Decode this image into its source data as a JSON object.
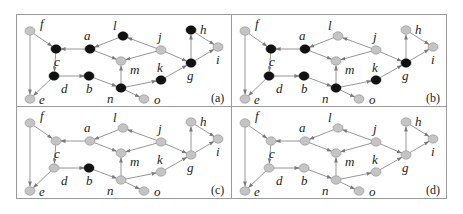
{
  "figure": {
    "colors": {
      "active_node": "#111111",
      "inactive_node": "#c4c4c4",
      "inactive_stroke": "#8f8f8f",
      "edge": "#8a8a8a",
      "border": "#9a9a9a"
    },
    "nodes": [
      {
        "id": "f",
        "x": 14,
        "y": 17,
        "lx": 10,
        "ly": -3
      },
      {
        "id": "c",
        "x": 40,
        "y": 35,
        "lx": -2,
        "ly": 17
      },
      {
        "id": "a",
        "x": 74,
        "y": 35,
        "lx": -6,
        "ly": -9
      },
      {
        "id": "l",
        "x": 107,
        "y": 22,
        "lx": -10,
        "ly": -6
      },
      {
        "id": "j",
        "x": 145,
        "y": 36,
        "lx": -3,
        "ly": -9
      },
      {
        "id": "h",
        "x": 175,
        "y": 16,
        "lx": 9,
        "ly": 4
      },
      {
        "id": "i",
        "x": 202,
        "y": 33,
        "lx": -2,
        "ly": 17
      },
      {
        "id": "m",
        "x": 105,
        "y": 47,
        "lx": 9,
        "ly": 13
      },
      {
        "id": "g",
        "x": 175,
        "y": 49,
        "lx": -4,
        "ly": 17
      },
      {
        "id": "d",
        "x": 38,
        "y": 62,
        "lx": 7,
        "ly": 17
      },
      {
        "id": "b",
        "x": 73,
        "y": 62,
        "lx": -3,
        "ly": 17
      },
      {
        "id": "k",
        "x": 145,
        "y": 66,
        "lx": -4,
        "ly": -8
      },
      {
        "id": "n",
        "x": 105,
        "y": 74,
        "lx": -14,
        "ly": 15
      },
      {
        "id": "e",
        "x": 14,
        "y": 85,
        "lx": 9,
        "ly": 5
      },
      {
        "id": "o",
        "x": 128,
        "y": 85,
        "lx": 10,
        "ly": 5
      }
    ],
    "edges": [
      [
        "f",
        "c"
      ],
      [
        "f",
        "e"
      ],
      [
        "c",
        "d"
      ],
      [
        "d",
        "e"
      ],
      [
        "d",
        "b"
      ],
      [
        "a",
        "c"
      ],
      [
        "l",
        "a"
      ],
      [
        "a",
        "m"
      ],
      [
        "j",
        "l"
      ],
      [
        "j",
        "m"
      ],
      [
        "j",
        "g"
      ],
      [
        "n",
        "m"
      ],
      [
        "b",
        "n"
      ],
      [
        "n",
        "k"
      ],
      [
        "n",
        "o"
      ],
      [
        "k",
        "g"
      ],
      [
        "g",
        "h"
      ],
      [
        "h",
        "i"
      ],
      [
        "g",
        "i"
      ]
    ],
    "panels": [
      {
        "label": "(a)",
        "x": 16,
        "y": 14,
        "active": [
          "c",
          "a",
          "l",
          "h",
          "d",
          "b",
          "n",
          "k",
          "g"
        ]
      },
      {
        "label": "(b)",
        "x": 231,
        "y": 14,
        "active": [
          "c",
          "a",
          "d",
          "b",
          "n",
          "k",
          "g"
        ]
      },
      {
        "label": "(c)",
        "x": 16,
        "y": 106,
        "active": [
          "b"
        ]
      },
      {
        "label": "(d)",
        "x": 231,
        "y": 106,
        "active": []
      }
    ],
    "panel_width": 215,
    "panel_height": 92
  }
}
